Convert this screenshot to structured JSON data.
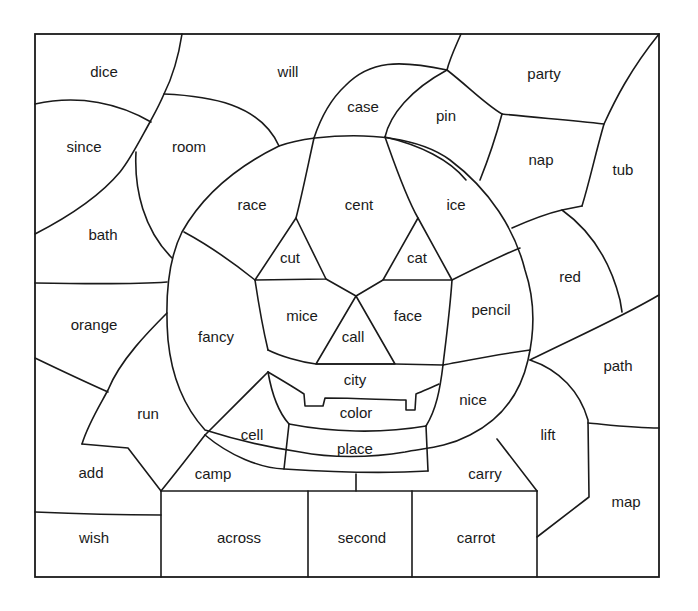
{
  "worksheet": {
    "type": "color-by-word picture",
    "ink_color": "#1a1a1a",
    "background_color": "#ffffff",
    "regions": [
      {
        "id": "dice",
        "word": "dice"
      },
      {
        "id": "will",
        "word": "will"
      },
      {
        "id": "party",
        "word": "party"
      },
      {
        "id": "case",
        "word": "case"
      },
      {
        "id": "pin",
        "word": "pin"
      },
      {
        "id": "since",
        "word": "since"
      },
      {
        "id": "room",
        "word": "room"
      },
      {
        "id": "nap",
        "word": "nap"
      },
      {
        "id": "tub",
        "word": "tub"
      },
      {
        "id": "race",
        "word": "race"
      },
      {
        "id": "cent",
        "word": "cent"
      },
      {
        "id": "ice",
        "word": "ice"
      },
      {
        "id": "bath",
        "word": "bath"
      },
      {
        "id": "cut",
        "word": "cut"
      },
      {
        "id": "cat",
        "word": "cat"
      },
      {
        "id": "red",
        "word": "red"
      },
      {
        "id": "orange",
        "word": "orange"
      },
      {
        "id": "fancy",
        "word": "fancy"
      },
      {
        "id": "mice",
        "word": "mice"
      },
      {
        "id": "face",
        "word": "face"
      },
      {
        "id": "pencil",
        "word": "pencil"
      },
      {
        "id": "call",
        "word": "call"
      },
      {
        "id": "path",
        "word": "path"
      },
      {
        "id": "city",
        "word": "city"
      },
      {
        "id": "run",
        "word": "run"
      },
      {
        "id": "color",
        "word": "color"
      },
      {
        "id": "nice",
        "word": "nice"
      },
      {
        "id": "lift",
        "word": "lift"
      },
      {
        "id": "cell",
        "word": "cell"
      },
      {
        "id": "place",
        "word": "place"
      },
      {
        "id": "add",
        "word": "add"
      },
      {
        "id": "camp",
        "word": "camp"
      },
      {
        "id": "carry",
        "word": "carry"
      },
      {
        "id": "map",
        "word": "map"
      },
      {
        "id": "wish",
        "word": "wish"
      },
      {
        "id": "across",
        "word": "across"
      },
      {
        "id": "second",
        "word": "second"
      },
      {
        "id": "carrot",
        "word": "carrot"
      }
    ]
  }
}
